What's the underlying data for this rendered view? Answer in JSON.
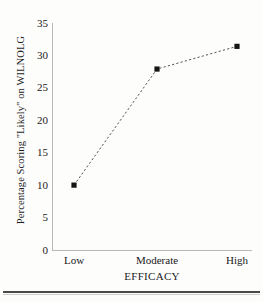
{
  "chart_data": {
    "type": "line",
    "title": "",
    "subtitle": "",
    "xlabel": "EFFICACY",
    "ylabel": "Percentage Scoring \"Likely\" on WILNOLG",
    "categories": [
      "Low",
      "Moderate",
      "High"
    ],
    "values": [
      10,
      27.9,
      31.4
    ],
    "series": [
      {
        "name": "Percentage Scoring \"Likely\" on WILNOLG",
        "values": [
          10,
          27.9,
          31.4
        ]
      }
    ],
    "ylim": [
      0,
      35
    ],
    "yticks": [
      0,
      5,
      10,
      15,
      20,
      25,
      30,
      35
    ],
    "ytick_labels": [
      "0",
      "5",
      "10",
      "15",
      "20",
      "25",
      "30",
      "35"
    ],
    "xtick_labels": [
      "Low",
      "Moderate",
      "High"
    ],
    "grid": false,
    "legend": false,
    "legend_position": "none",
    "line_style": "dashed",
    "marker_style": "square",
    "colors": {
      "line": "#555555",
      "marker": "#151515",
      "axis": "#b9b9b9",
      "text": "#1c1c1c",
      "background": "#fdfdfc"
    },
    "annotations": []
  },
  "figure": {
    "y_axis_title": "Percentage Scoring \"Likely\" on WILNOLG",
    "x_axis_title": "EFFICACY"
  }
}
